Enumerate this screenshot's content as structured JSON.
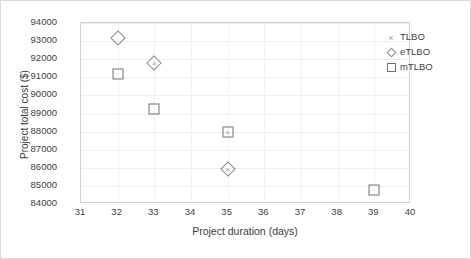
{
  "chart_data": {
    "type": "scatter",
    "title": "",
    "xlabel": "Project duration (days)",
    "ylabel": "Project total cost ($)",
    "xlim": [
      31,
      40
    ],
    "ylim": [
      84000,
      94000
    ],
    "xticks": [
      31,
      32,
      33,
      34,
      35,
      36,
      37,
      38,
      39,
      40
    ],
    "yticks": [
      84000,
      85000,
      86000,
      87000,
      88000,
      89000,
      90000,
      91000,
      92000,
      93000,
      94000
    ],
    "grid": true,
    "legend_position": "right",
    "series": [
      {
        "name": "TLBO",
        "marker": "cross",
        "color": "#9a9a9a",
        "points": [
          {
            "x": 33,
            "y": 91800
          },
          {
            "x": 35,
            "y": 88000
          },
          {
            "x": 35,
            "y": 85950
          }
        ]
      },
      {
        "name": "eTLBO",
        "marker": "diamond",
        "color": "#8a8a8a",
        "points": [
          {
            "x": 32,
            "y": 93150
          },
          {
            "x": 33,
            "y": 91800
          },
          {
            "x": 35,
            "y": 85950
          }
        ]
      },
      {
        "name": "mTLBO",
        "marker": "square",
        "color": "#6f6f6f",
        "points": [
          {
            "x": 32,
            "y": 91200
          },
          {
            "x": 33,
            "y": 89250
          },
          {
            "x": 35,
            "y": 88000
          },
          {
            "x": 39,
            "y": 84800
          }
        ]
      }
    ]
  },
  "legend": {
    "items": [
      {
        "label": "TLBO",
        "marker": "cross-marker-icon"
      },
      {
        "label": "eTLBO",
        "marker": "diamond-marker-icon"
      },
      {
        "label": "mTLBO",
        "marker": "square-marker-icon"
      }
    ]
  }
}
